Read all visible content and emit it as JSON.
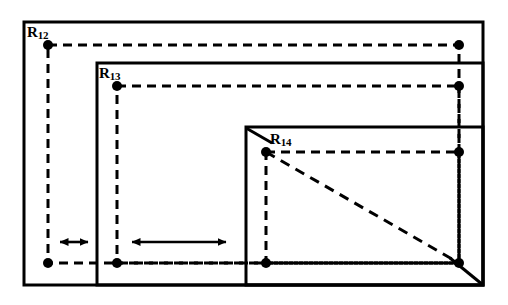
{
  "figure": {
    "background_color": "#ffffff",
    "stroke_color": "#000000",
    "solid_stroke_width": 3,
    "dashed_stroke_width": 3,
    "dash_pattern": "9 6",
    "dot_radius": 5,
    "labels": [
      {
        "id": "R12",
        "base": "R",
        "sub": "12",
        "x": 27,
        "y": 24
      },
      {
        "id": "R13",
        "base": "R",
        "sub": "13",
        "x": 99,
        "y": 65
      },
      {
        "id": "R14",
        "base": "R",
        "sub": "14",
        "x": 270,
        "y": 131
      }
    ],
    "solid_rectangles": [
      {
        "name": "rect-R12",
        "x": 24,
        "y": 22,
        "width": 459,
        "height": 263
      },
      {
        "name": "rect-R13",
        "x": 97,
        "y": 63,
        "width": 386,
        "height": 222
      },
      {
        "name": "rect-R14",
        "x": 246,
        "y": 127,
        "width": 237,
        "height": 158
      }
    ],
    "dashed_rectangles": [
      {
        "name": "dashed-R12",
        "x": 48,
        "y": 45,
        "width": 411,
        "height": 218
      },
      {
        "name": "dashed-R13",
        "x": 117,
        "y": 86,
        "width": 342,
        "height": 177
      },
      {
        "name": "dashed-R14",
        "x": 266,
        "y": 152,
        "width": 193,
        "height": 111
      }
    ],
    "dashed_diagonal": {
      "name": "diagonal-dashed",
      "x1": 266,
      "y1": 152,
      "x2": 459,
      "y2": 263
    },
    "solid_diagonal_segments": [
      {
        "name": "diagonal-solid-upper",
        "x1": 246,
        "y1": 128,
        "x2": 270,
        "y2": 142
      },
      {
        "name": "diagonal-solid-lower",
        "x1": 452,
        "y1": 259,
        "x2": 483,
        "y2": 285
      }
    ],
    "corner_dots": [
      {
        "name": "dot-R12-topleft",
        "cx": 48,
        "cy": 45
      },
      {
        "name": "dot-R12-topright",
        "cx": 459,
        "cy": 45
      },
      {
        "name": "dot-R12-bottomleft",
        "cx": 48,
        "cy": 263
      },
      {
        "name": "dot-R13-topleft",
        "cx": 117,
        "cy": 86
      },
      {
        "name": "dot-R13-topright",
        "cx": 459,
        "cy": 86
      },
      {
        "name": "dot-R13-bottomleft",
        "cx": 117,
        "cy": 263
      },
      {
        "name": "dot-R14-topleft",
        "cx": 266,
        "cy": 152
      },
      {
        "name": "dot-R14-topright",
        "cx": 459,
        "cy": 152
      },
      {
        "name": "dot-R14-bottomleft",
        "cx": 266,
        "cy": 263
      },
      {
        "name": "dot-R14-bottomright",
        "cx": 459,
        "cy": 263
      }
    ],
    "arrows": [
      {
        "name": "arrow-small",
        "x1": 58,
        "x2": 90,
        "y": 242,
        "double_headed": true
      },
      {
        "name": "arrow-large",
        "x1": 130,
        "x2": 228,
        "y": 242,
        "double_headed": true
      }
    ]
  }
}
